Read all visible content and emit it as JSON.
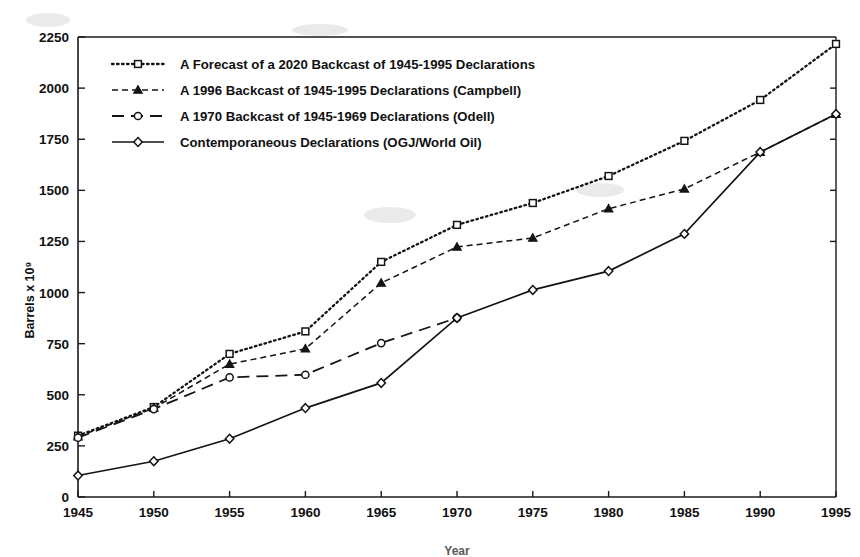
{
  "chart_data": {
    "type": "line",
    "title": "",
    "xlabel": "Year",
    "ylabel": "Barrels x 10⁹",
    "x": [
      1945,
      1950,
      1955,
      1960,
      1965,
      1970,
      1975,
      1980,
      1985,
      1990,
      1995
    ],
    "xticklabels": [
      "1945",
      "1950",
      "1955",
      "1960",
      "1965",
      "1970",
      "1975",
      "1980",
      "1985",
      "1990",
      "1995"
    ],
    "yticklabels": [
      "0",
      "250",
      "500",
      "750",
      "1000",
      "1250",
      "1500",
      "1750",
      "2000",
      "2250"
    ],
    "yticks": [
      0,
      250,
      500,
      750,
      1000,
      1250,
      1500,
      1750,
      2000,
      2250
    ],
    "xlim": [
      1945,
      1995
    ],
    "ylim": [
      0,
      2250
    ],
    "grid": false,
    "legend_position": "upper left",
    "series": [
      {
        "name": "A Forecast of a 2020 Backcast of 1945-1995 Declarations",
        "marker": "square",
        "dash": "dotted",
        "x": [
          1945,
          1950,
          1955,
          1960,
          1965,
          1970,
          1975,
          1980,
          1985,
          1990,
          1995
        ],
        "values": [
          300,
          440,
          700,
          810,
          1150,
          1331,
          1438,
          1570,
          1742,
          1942,
          2216
        ]
      },
      {
        "name": "A 1996 Backcast of 1945-1995 Declarations (Campbell)",
        "marker": "triangle",
        "dash": "dashed-short",
        "x": [
          1945,
          1950,
          1955,
          1960,
          1965,
          1970,
          1975,
          1980,
          1985,
          1990,
          1995
        ],
        "values": [
          295,
          435,
          650,
          725,
          1047,
          1223,
          1267,
          1410,
          1507,
          1687,
          1873
        ]
      },
      {
        "name": "A 1970 Backcast of 1945-1969 Declarations (Odell)",
        "marker": "circle",
        "dash": "dashed-long",
        "x": [
          1945,
          1950,
          1955,
          1960,
          1965,
          1970
        ],
        "values": [
          290,
          430,
          585,
          598,
          753,
          876
        ]
      },
      {
        "name": "Contemporaneous Declarations (OGJ/World Oil)",
        "marker": "diamond",
        "dash": "solid",
        "x": [
          1945,
          1950,
          1955,
          1960,
          1965,
          1970,
          1975,
          1980,
          1985,
          1990,
          1995
        ],
        "values": [
          105,
          175,
          285,
          435,
          558,
          876,
          1013,
          1105,
          1287,
          1687,
          1873
        ]
      }
    ]
  },
  "legend": {
    "items": [
      {
        "label": "A Forecast of a 2020 Backcast of 1945-1995 Declarations"
      },
      {
        "label": "A 1996 Backcast of 1945-1995 Declarations (Campbell)"
      },
      {
        "label": "A 1970 Backcast of 1945-1969 Declarations (Odell)"
      },
      {
        "label": "Contemporaneous Declarations (OGJ/World Oil)"
      }
    ]
  },
  "axes": {
    "y_title": "Barrels x 10⁹",
    "x_title": "Year"
  }
}
